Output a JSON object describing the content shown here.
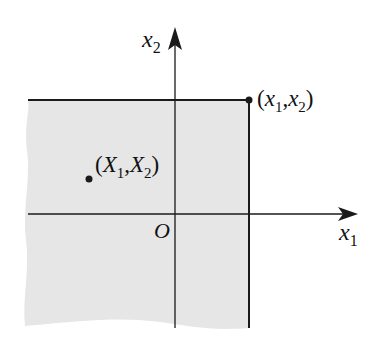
{
  "diagram": {
    "type": "coordinate-plane-region",
    "axes": {
      "horizontal": {
        "label": "x",
        "subscript": "1"
      },
      "vertical": {
        "label": "x",
        "subscript": "2"
      },
      "origin_label": "O"
    },
    "points": [
      {
        "name": "corner",
        "label_open": "(",
        "v1": "x",
        "s1": "1",
        "sep": ",",
        "v2": "x",
        "s2": "2",
        "label_close": ")"
      },
      {
        "name": "random-point",
        "label_open": "(",
        "v1": "X",
        "s1": "1",
        "sep": ",",
        "v2": "X",
        "s2": "2",
        "label_close": ")"
      }
    ],
    "colors": {
      "shade": "#e6e6e6",
      "line": "#1a1a1a",
      "background": "#ffffff"
    }
  }
}
